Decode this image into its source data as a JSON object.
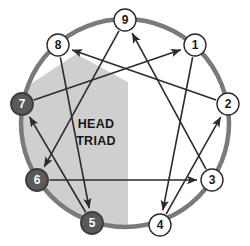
{
  "diagram": {
    "type": "enneagram",
    "background_color": "#ffffff",
    "circle": {
      "name": "enneagram-outer-circle",
      "center_x": 125,
      "center_y": 123,
      "radius": 104,
      "stroke_color": "#7a7a7a",
      "stroke_width": 4.5
    },
    "triad_region": {
      "label_line1": "HEAD",
      "label_line2": "TRIAD",
      "fill_color": "#cfcfcf",
      "text_color": "#161616",
      "members": [
        5,
        6,
        7
      ]
    },
    "node_style": {
      "radius": 11,
      "plain_fill": "#ffffff",
      "plain_stroke": "#2b2b2b",
      "highlight_fill": "#5a5a5a",
      "highlight_stroke": "#3d3d3d",
      "plain_text_color": "#1a1a1a",
      "highlight_text_color": "#ffffff"
    },
    "line_color": "#2b2b2b",
    "line_width": 1.6,
    "nodes": [
      {
        "id": 1,
        "label": "1",
        "x": 195,
        "y": 45,
        "highlighted": false
      },
      {
        "id": 2,
        "label": "2",
        "x": 228,
        "y": 104,
        "highlighted": false
      },
      {
        "id": 3,
        "label": "3",
        "x": 212,
        "y": 180,
        "highlighted": false
      },
      {
        "id": 4,
        "label": "4",
        "x": 160,
        "y": 225,
        "highlighted": false
      },
      {
        "id": 5,
        "label": "5",
        "x": 92,
        "y": 223,
        "highlighted": true
      },
      {
        "id": 6,
        "label": "6",
        "x": 37,
        "y": 180,
        "highlighted": true
      },
      {
        "id": 7,
        "label": "7",
        "x": 22,
        "y": 104,
        "highlighted": true
      },
      {
        "id": 8,
        "label": "8",
        "x": 58,
        "y": 45,
        "highlighted": false
      },
      {
        "id": 9,
        "label": "9",
        "x": 125,
        "y": 20,
        "highlighted": false
      }
    ],
    "arrows": [
      {
        "name": "arrow-9-to-6",
        "from": 9,
        "to": 6,
        "group": "triangle"
      },
      {
        "name": "arrow-6-to-3",
        "from": 6,
        "to": 3,
        "group": "triangle"
      },
      {
        "name": "arrow-3-to-9",
        "from": 3,
        "to": 9,
        "group": "triangle"
      },
      {
        "name": "arrow-1-to-4",
        "from": 1,
        "to": 4,
        "group": "hexad"
      },
      {
        "name": "arrow-4-to-2",
        "from": 4,
        "to": 2,
        "group": "hexad"
      },
      {
        "name": "arrow-2-to-8",
        "from": 2,
        "to": 8,
        "group": "hexad"
      },
      {
        "name": "arrow-8-to-5",
        "from": 8,
        "to": 5,
        "group": "hexad"
      },
      {
        "name": "arrow-5-to-7",
        "from": 5,
        "to": 7,
        "group": "hexad"
      },
      {
        "name": "arrow-7-to-1",
        "from": 7,
        "to": 1,
        "group": "hexad"
      }
    ]
  }
}
